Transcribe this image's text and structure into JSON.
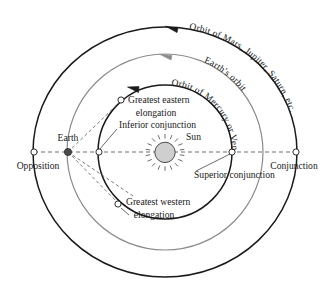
{
  "diagram": {
    "center": {
      "x": 165,
      "y": 152
    },
    "colors": {
      "outer_orbit": "#1a1a1a",
      "earth_orbit": "#8c8c8c",
      "inner_orbit": "#1a1a1a",
      "sun_fill": "#cfcfcf",
      "earth_fill": "#4a4a4a",
      "text": "#1a1a1a",
      "dashed_line": "#555555",
      "background": "#ffffff"
    },
    "orbits": [
      {
        "id": "outer-orbit",
        "name": "Orbit of Mars, Jupiter, Saturn, etc.",
        "label": "Orbit of Mars, Jupiter, Saturn, etc.",
        "radius_x": 132,
        "radius_y": 125,
        "stroke": "#1a1a1a",
        "stroke_width": 1.5,
        "direction": "counterclockwise",
        "arrow_color": "#1a1a1a"
      },
      {
        "id": "earth-orbit",
        "name": "Earth's orbit",
        "label": "Earth's orbit",
        "radius_x": 98,
        "radius_y": 98,
        "stroke": "#8c8c8c",
        "stroke_width": 1.2,
        "direction": "counterclockwise",
        "arrow_color": "#8c8c8c"
      },
      {
        "id": "inner-orbit",
        "name": "Orbit of Mercury or Venus",
        "label": "Orbit of Mercury or Venus",
        "radius_x": 67,
        "radius_y": 67,
        "stroke": "#1a1a1a",
        "stroke_width": 1.5,
        "direction": "counterclockwise",
        "arrow_color": "#1a1a1a"
      }
    ],
    "bodies": [
      {
        "id": "sun",
        "label": "Sun",
        "type": "sun",
        "x": 165,
        "y": 152
      },
      {
        "id": "earth",
        "label": "Earth",
        "type": "filled-dot",
        "x": 68,
        "y": 152
      }
    ],
    "markers": [
      {
        "id": "opposition",
        "label": "Opposition",
        "type": "open-circle",
        "x": 34,
        "y": 152
      },
      {
        "id": "conjunction",
        "label": "Conjunction",
        "type": "open-circle",
        "x": 296,
        "y": 152
      },
      {
        "id": "inferior-conjunction",
        "label": "Inferior conjunction",
        "type": "open-circle",
        "x": 99,
        "y": 152
      },
      {
        "id": "superior-conjunction",
        "label": "Superior conjunction",
        "type": "open-circle",
        "x": 232,
        "y": 152
      },
      {
        "id": "greatest-eastern-elongation",
        "label": "Greatest  eastern elongation",
        "label_line1": "Greatest  eastern",
        "label_line2": "elongation",
        "type": "open-circle",
        "x": 121,
        "y": 100
      },
      {
        "id": "greatest-western-elongation",
        "label": "Greatest  western elongation",
        "label_line1": "Greatest  western",
        "label_line2": "elongation",
        "type": "open-circle",
        "x": 118,
        "y": 204
      }
    ],
    "labels": {
      "sun": "Sun",
      "earth": "Earth",
      "opposition": "Opposition",
      "conjunction": "Conjunction",
      "inferior_conjunction": "Inferior conjunction",
      "superior_conjunction": "Superior conjunction",
      "greatest_eastern_1": "Greatest  eastern",
      "greatest_eastern_2": "elongation",
      "greatest_western_1": "Greatest  western",
      "greatest_western_2": "elongation",
      "outer_orbit": "Orbit of Mars, Jupiter, Saturn, etc.",
      "earth_orbit": "Earth's orbit",
      "inner_orbit": "Orbit of Mercury or Venus"
    }
  }
}
